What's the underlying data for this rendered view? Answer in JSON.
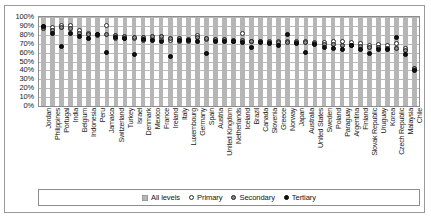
{
  "chart_data": {
    "type": "scatter",
    "title": "",
    "subtitle": "",
    "xlabel": "",
    "ylabel": "",
    "ylim": [
      0,
      100
    ],
    "y_tick_labels": [
      "100%",
      "90%",
      "80%",
      "70%",
      "60%",
      "50%",
      "40%",
      "30%",
      "20%",
      "10%",
      "0%"
    ],
    "y_ticks": [
      100,
      90,
      80,
      70,
      60,
      50,
      40,
      30,
      20,
      10,
      0
    ],
    "grid": true,
    "legend_position": "bottom",
    "legend": [
      "All levels",
      "Primary",
      "Secondary",
      "Tertiary"
    ],
    "categories": [
      "Jordan",
      "Philippines",
      "Portugal",
      "India",
      "Belgium",
      "Indonesia",
      "Peru",
      "Jamaica",
      "Switzerland",
      "Turkey",
      "Israel",
      "Denmark",
      "Mexico",
      "France",
      "Ireland",
      "Italy",
      "Luxembourg",
      "Germany",
      "Spain",
      "Austria",
      "United Kingdom",
      "Netherlands",
      "Iceland",
      "Brazil",
      "Canada",
      "Slovenia",
      "Greece",
      "Norway",
      "Japan",
      "Australia",
      "United States",
      "Sweden",
      "Poland",
      "Paraguay",
      "Argentina",
      "Finland",
      "Slovak Republic",
      "Uruguay",
      "Korea",
      "Czech Republic",
      "Malaysia",
      "Chile"
    ],
    "series": [
      {
        "name": "All levels",
        "marker": "bar",
        "values": [
          100,
          100,
          100,
          100,
          100,
          100,
          100,
          100,
          100,
          100,
          100,
          100,
          100,
          100,
          100,
          100,
          100,
          100,
          100,
          100,
          100,
          100,
          100,
          100,
          100,
          100,
          100,
          100,
          100,
          100,
          100,
          100,
          100,
          100,
          100,
          100,
          100,
          100,
          100,
          100,
          100,
          100
        ]
      },
      {
        "name": "Primary",
        "marker": "open-circle",
        "values": [
          89,
          88,
          91,
          90,
          85,
          81,
          80,
          90,
          76,
          76,
          76,
          74,
          75,
          75,
          74,
          73,
          73,
          79,
          75,
          74,
          74,
          73,
          82,
          73,
          72,
          72,
          73,
          73,
          73,
          73,
          71,
          71,
          72,
          72,
          71,
          70,
          68,
          69,
          68,
          70,
          65,
          41
        ]
      },
      {
        "name": "Secondary",
        "marker": "filled-gray-circle",
        "values": [
          87,
          85,
          88,
          87,
          82,
          80,
          79,
          80,
          79,
          78,
          77,
          77,
          78,
          78,
          76,
          76,
          75,
          77,
          76,
          75,
          75,
          74,
          74,
          72,
          72,
          71,
          71,
          71,
          71,
          71,
          70,
          69,
          69,
          68,
          68,
          67,
          66,
          66,
          65,
          65,
          62,
          42
        ]
      },
      {
        "name": "Tertiary",
        "marker": "filled-black-circle",
        "values": [
          89,
          82,
          67,
          81,
          78,
          76,
          80,
          60,
          77,
          76,
          58,
          75,
          74,
          73,
          56,
          74,
          74,
          73,
          59,
          73,
          72,
          72,
          71,
          66,
          71,
          70,
          68,
          80,
          70,
          60,
          69,
          66,
          65,
          64,
          68,
          63,
          59,
          64,
          63,
          77,
          58,
          40
        ]
      }
    ]
  },
  "legend": {
    "items": [
      {
        "label": "All levels",
        "marker": "bar-swatch"
      },
      {
        "label": "Primary",
        "marker": "open-circle"
      },
      {
        "label": "Secondary",
        "marker": "filled-gray-circle"
      },
      {
        "label": "Tertiary",
        "marker": "filled-black-circle"
      }
    ]
  }
}
